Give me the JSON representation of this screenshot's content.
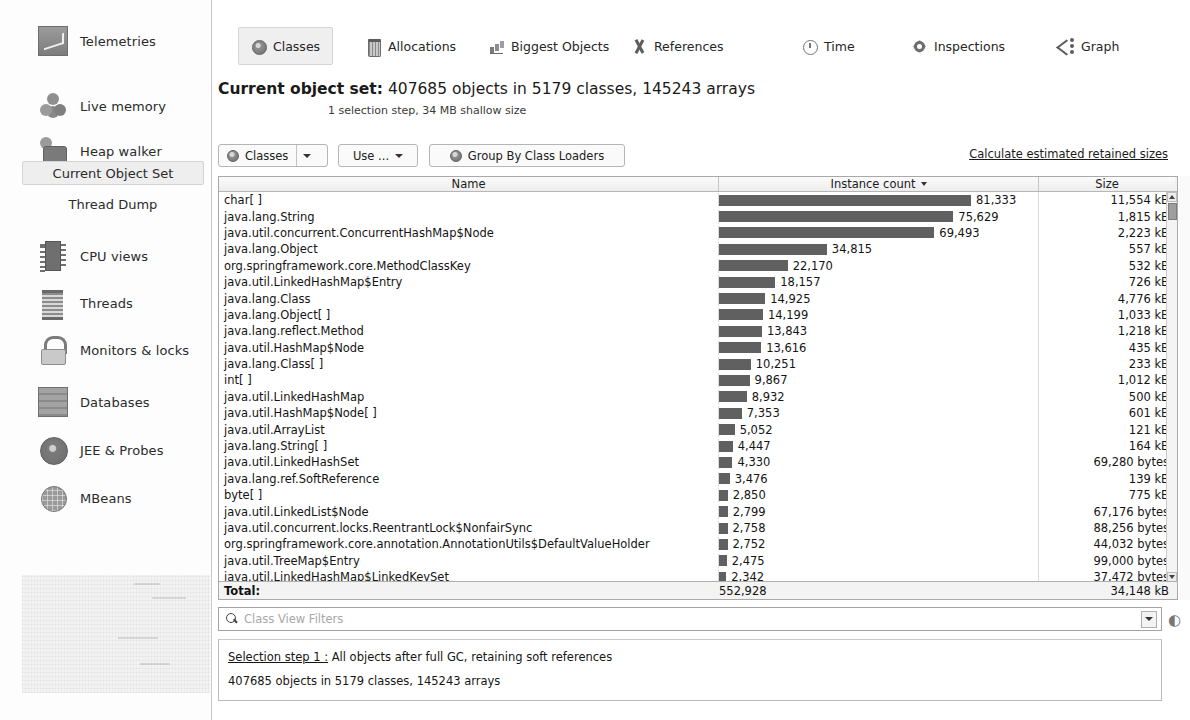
{
  "sidebar": {
    "items": [
      {
        "label": "Telemetries",
        "icon": "telemetries-icon",
        "type": "main"
      },
      {
        "label": "Live memory",
        "icon": "live-memory-icon",
        "type": "main"
      },
      {
        "label": "Heap walker",
        "icon": "heap-walker-icon",
        "type": "main"
      },
      {
        "label": "Current Object Set",
        "icon": "",
        "type": "sub",
        "selected": true
      },
      {
        "label": "Thread Dump",
        "icon": "",
        "type": "sub",
        "selected": false
      },
      {
        "label": "CPU views",
        "icon": "cpu-icon",
        "type": "main"
      },
      {
        "label": "Threads",
        "icon": "threads-icon",
        "type": "main"
      },
      {
        "label": "Monitors & locks",
        "icon": "lock-icon",
        "type": "main"
      },
      {
        "label": "Databases",
        "icon": "database-icon",
        "type": "main"
      },
      {
        "label": "JEE & Probes",
        "icon": "jee-probes-icon",
        "type": "main"
      },
      {
        "label": "MBeans",
        "icon": "mbeans-icon",
        "type": "main"
      }
    ]
  },
  "tabs": [
    {
      "label": "Classes",
      "icon": "classes-icon",
      "active": true
    },
    {
      "label": "Allocations",
      "icon": "allocations-icon",
      "active": false
    },
    {
      "label": "Biggest Objects",
      "icon": "biggest-objects-icon",
      "active": false
    },
    {
      "label": "References",
      "icon": "references-icon",
      "active": false
    },
    {
      "label": "Time",
      "icon": "time-icon",
      "active": false
    },
    {
      "label": "Inspections",
      "icon": "inspections-icon",
      "active": false
    },
    {
      "label": "Graph",
      "icon": "graph-icon",
      "active": false
    }
  ],
  "header": {
    "title_label": "Current object set:",
    "title_value": "407685 objects in 5179 classes, 145243 arrays",
    "subtitle": "1 selection step, 34 MB shallow size"
  },
  "toolbar": {
    "classes_button": "Classes",
    "use_button": "Use ...",
    "group_button": "Group By Class Loaders",
    "retained_link": "Calculate estimated retained sizes"
  },
  "table": {
    "columns": [
      "Name",
      "Instance count",
      "Size"
    ],
    "sorted_column": "Instance count",
    "sort_direction": "desc",
    "bar_color": "#606060",
    "max_count": 81333,
    "rows": [
      {
        "name": "char[ ]",
        "count": "81,333",
        "count_value": 81333,
        "size": "11,554 kB"
      },
      {
        "name": "java.lang.String",
        "count": "75,629",
        "count_value": 75629,
        "size": "1,815 kB"
      },
      {
        "name": "java.util.concurrent.ConcurrentHashMap$Node",
        "count": "69,493",
        "count_value": 69493,
        "size": "2,223 kB"
      },
      {
        "name": "java.lang.Object",
        "count": "34,815",
        "count_value": 34815,
        "size": "557 kB"
      },
      {
        "name": "org.springframework.core.MethodClassKey",
        "count": "22,170",
        "count_value": 22170,
        "size": "532 kB"
      },
      {
        "name": "java.util.LinkedHashMap$Entry",
        "count": "18,157",
        "count_value": 18157,
        "size": "726 kB"
      },
      {
        "name": "java.lang.Class",
        "count": "14,925",
        "count_value": 14925,
        "size": "4,776 kB"
      },
      {
        "name": "java.lang.Object[ ]",
        "count": "14,199",
        "count_value": 14199,
        "size": "1,033 kB"
      },
      {
        "name": "java.lang.reflect.Method",
        "count": "13,843",
        "count_value": 13843,
        "size": "1,218 kB"
      },
      {
        "name": "java.util.HashMap$Node",
        "count": "13,616",
        "count_value": 13616,
        "size": "435 kB"
      },
      {
        "name": "java.lang.Class[ ]",
        "count": "10,251",
        "count_value": 10251,
        "size": "233 kB"
      },
      {
        "name": "int[ ]",
        "count": "9,867",
        "count_value": 9867,
        "size": "1,012 kB"
      },
      {
        "name": "java.util.LinkedHashMap",
        "count": "8,932",
        "count_value": 8932,
        "size": "500 kB"
      },
      {
        "name": "java.util.HashMap$Node[ ]",
        "count": "7,353",
        "count_value": 7353,
        "size": "601 kB"
      },
      {
        "name": "java.util.ArrayList",
        "count": "5,052",
        "count_value": 5052,
        "size": "121 kB"
      },
      {
        "name": "java.lang.String[ ]",
        "count": "4,447",
        "count_value": 4447,
        "size": "164 kB"
      },
      {
        "name": "java.util.LinkedHashSet",
        "count": "4,330",
        "count_value": 4330,
        "size": "69,280 bytes"
      },
      {
        "name": "java.lang.ref.SoftReference",
        "count": "3,476",
        "count_value": 3476,
        "size": "139 kB"
      },
      {
        "name": "byte[ ]",
        "count": "2,850",
        "count_value": 2850,
        "size": "775 kB"
      },
      {
        "name": "java.util.LinkedList$Node",
        "count": "2,799",
        "count_value": 2799,
        "size": "67,176 bytes"
      },
      {
        "name": "java.util.concurrent.locks.ReentrantLock$NonfairSync",
        "count": "2,758",
        "count_value": 2758,
        "size": "88,256 bytes"
      },
      {
        "name": "org.springframework.core.annotation.AnnotationUtils$DefaultValueHolder",
        "count": "2,752",
        "count_value": 2752,
        "size": "44,032 bytes"
      },
      {
        "name": "java.util.TreeMap$Entry",
        "count": "2,475",
        "count_value": 2475,
        "size": "99,000 bytes"
      },
      {
        "name": "java.util.LinkedHashMap$LinkedKeySet",
        "count": "2,342",
        "count_value": 2342,
        "size": "37,472 bytes"
      },
      {
        "name": "java.util.LinkedList",
        "count": "2,237",
        "count_value": 2237,
        "size": "71,584 bytes"
      }
    ],
    "total": {
      "label": "Total:",
      "count": "552,928",
      "size": "34,148 kB"
    }
  },
  "search": {
    "placeholder": "Class View Filters",
    "value": ""
  },
  "selection_step": {
    "link": "Selection step 1 :",
    "description": "All objects after full GC, retaining soft references",
    "summary": "407685 objects in 5179 classes, 145243 arrays"
  },
  "chart_data": {
    "type": "bar",
    "xlabel": "Instance count",
    "ylabel": "Class name",
    "categories": [
      "char[ ]",
      "java.lang.String",
      "java.util.concurrent.ConcurrentHashMap$Node",
      "java.lang.Object",
      "org.springframework.core.MethodClassKey",
      "java.util.LinkedHashMap$Entry",
      "java.lang.Class",
      "java.lang.Object[ ]",
      "java.lang.reflect.Method",
      "java.util.HashMap$Node",
      "java.lang.Class[ ]",
      "int[ ]",
      "java.util.LinkedHashMap",
      "java.util.HashMap$Node[ ]",
      "java.util.ArrayList",
      "java.lang.String[ ]",
      "java.util.LinkedHashSet",
      "java.lang.ref.SoftReference",
      "byte[ ]",
      "java.util.LinkedList$Node",
      "java.util.concurrent.locks.ReentrantLock$NonfairSync",
      "org.springframework.core.annotation.AnnotationUtils$DefaultValueHolder",
      "java.util.TreeMap$Entry",
      "java.util.LinkedHashMap$LinkedKeySet",
      "java.util.LinkedList"
    ],
    "values": [
      81333,
      75629,
      69493,
      34815,
      22170,
      18157,
      14925,
      14199,
      13843,
      13616,
      10251,
      9867,
      8932,
      7353,
      5052,
      4447,
      4330,
      3476,
      2850,
      2799,
      2758,
      2752,
      2475,
      2342,
      2237
    ],
    "xlim": [
      0,
      81333
    ],
    "grid": false,
    "legend": "none"
  }
}
